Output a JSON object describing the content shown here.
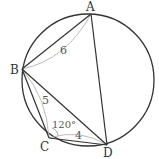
{
  "diagram": {
    "type": "cyclic-quadrilateral",
    "colors": {
      "circle": "#333333",
      "edge": "#333333",
      "length_marker": "#bbbbbb",
      "label": "#333333"
    },
    "circle": {
      "cx": 88,
      "cy": 80,
      "r": 66
    },
    "points": {
      "A": {
        "label": "A",
        "x": 91,
        "y": 14
      },
      "B": {
        "label": "B",
        "x": 22,
        "y": 69
      },
      "C": {
        "label": "C",
        "x": 49,
        "y": 138
      },
      "D": {
        "label": "D",
        "x": 107,
        "y": 145
      }
    },
    "segments": [
      "AB",
      "BC",
      "CD",
      "DA",
      "BD"
    ],
    "lengths": {
      "AB": "6",
      "BC": "5",
      "CD": "4"
    },
    "angles": {
      "C": "120°"
    }
  }
}
